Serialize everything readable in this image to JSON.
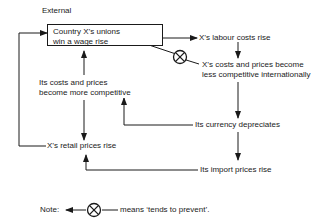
{
  "diagram": {
    "header": "External",
    "nodes": {
      "wage_rise": {
        "line1": "Country X’s unions",
        "line2": "win a wage rise"
      },
      "labour_costs": "X’s labour costs rise",
      "less_competitive": {
        "line1": "X’s costs and prices become",
        "line2": "less competitive internationally"
      },
      "more_competitive": {
        "line1": "Its costs and prices",
        "line2": "become more competitive"
      },
      "currency": "Its currency depreciates",
      "retail": "X’s retail prices rise",
      "import": "Its import prices rise"
    },
    "note": {
      "label": "Note:",
      "meaning": "means ‘tends to prevent’."
    },
    "edges": [
      {
        "from": "wage_rise",
        "to": "labour_costs",
        "type": "causes"
      },
      {
        "from": "labour_costs",
        "to": "less_competitive",
        "type": "causes"
      },
      {
        "from": "less_competitive",
        "to": "wage_rise",
        "type": "tends-to-prevent"
      },
      {
        "from": "less_competitive",
        "to": "currency",
        "type": "causes"
      },
      {
        "from": "currency",
        "to": "more_competitive",
        "type": "causes"
      },
      {
        "from": "more_competitive",
        "to": "wage_rise",
        "type": "causes"
      },
      {
        "from": "currency",
        "to": "import",
        "type": "causes"
      },
      {
        "from": "import",
        "to": "retail",
        "type": "causes"
      },
      {
        "from": "more_competitive",
        "to": "retail",
        "type": "causes"
      },
      {
        "from": "retail",
        "to": "wage_rise",
        "type": "causes"
      }
    ],
    "colors": {
      "ink": "#1a1a1a",
      "background": "#ffffff"
    }
  }
}
